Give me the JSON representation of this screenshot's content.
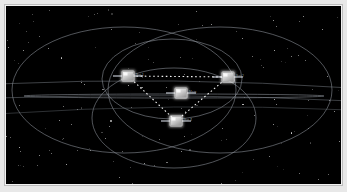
{
  "window": {
    "title": "Satellite Constellation Viewer",
    "canvas_background": "#000000",
    "frame_color": "#f2f2f2"
  },
  "scene": {
    "name": "orbital-constellation-3d",
    "orbit_color": "#8e949c",
    "link_color": "#ffffff",
    "star_color": "#ffffff",
    "label_color": "#9aa0a6"
  },
  "satellites": [
    {
      "id": "main",
      "label": "Main",
      "x": 175,
      "y": 87,
      "icon": "satellite-icon"
    },
    {
      "id": "sat1",
      "label": "Sat 1",
      "x": 122,
      "y": 70,
      "icon": "satellite-icon"
    },
    {
      "id": "sat2",
      "label": "Sat 2",
      "x": 222,
      "y": 71,
      "icon": "satellite-icon"
    },
    {
      "id": "sat3",
      "label": "Sat 3",
      "x": 170,
      "y": 115,
      "icon": "satellite-icon"
    }
  ],
  "links": [
    {
      "from": "sat1",
      "to": "sat2",
      "style": "dotted"
    },
    {
      "from": "sat1",
      "to": "sat3",
      "style": "dotted"
    },
    {
      "from": "sat2",
      "to": "sat3",
      "style": "dotted"
    }
  ],
  "orbits": [
    {
      "id": "orbit-outer-left",
      "cx": 118,
      "cy": 84,
      "rx": 112,
      "ry": 63
    },
    {
      "id": "orbit-outer-right",
      "cx": 214,
      "cy": 84,
      "rx": 112,
      "ry": 63
    },
    {
      "id": "orbit-inner-upper",
      "cx": 166,
      "cy": 73,
      "rx": 70,
      "ry": 40
    },
    {
      "id": "orbit-inner-lower",
      "cx": 168,
      "cy": 112,
      "rx": 82,
      "ry": 50
    },
    {
      "id": "orbit-equatorial",
      "cx": 168,
      "cy": 90,
      "rx": 150,
      "ry": 2
    }
  ]
}
